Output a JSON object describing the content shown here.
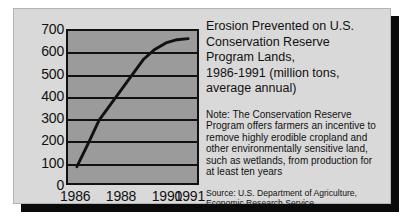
{
  "panel": {
    "background_color": "#d9d9d9",
    "shadow_color": "#0a0a0a"
  },
  "title_text": "Erosion Prevented on U.S.\nConservation Reserve\nProgram Lands,\n1986-1991 (million tons,\naverage annual)",
  "note_text": "Note: The Conservation Reserve\nProgram offers farmers an incentive to\nremove highly erodible cropland and\nother environmentally sensitive land,\nsuch as wetlands, from production for\nat least ten years",
  "source_text": "Source: U.S. Department of Agriculture,\nEconomic Research Service",
  "chart_data": {
    "type": "line",
    "title": "Erosion Prevented on U.S. Conservation Reserve Program Lands, 1986-1991 (million tons, average annual)",
    "xlabel": "",
    "ylabel": "",
    "xlim": [
      1985.6,
      1991.4
    ],
    "ylim": [
      0,
      700
    ],
    "grid": true,
    "legend": "none",
    "plot_background_color": "#9b9b9b",
    "line_color": "#111111",
    "x_tick_labels": [
      "1986",
      "1988",
      "1990",
      "1991"
    ],
    "x_tick_values": [
      1986,
      1988,
      1990,
      1991
    ],
    "y_tick_labels": [
      "0",
      "100",
      "200",
      "300",
      "400",
      "500",
      "600",
      "700"
    ],
    "y_tick_values": [
      0,
      100,
      200,
      300,
      400,
      500,
      600,
      700
    ],
    "x": [
      1986,
      1986.5,
      1987,
      1987.5,
      1988,
      1988.5,
      1989,
      1989.5,
      1990,
      1990.5,
      1991
    ],
    "values": [
      75,
      180,
      290,
      360,
      430,
      500,
      570,
      615,
      645,
      660,
      665
    ],
    "series": [
      {
        "name": "Erosion prevented (million tons, average annual)",
        "values": [
          75,
          180,
          290,
          360,
          430,
          500,
          570,
          615,
          645,
          660,
          665
        ]
      }
    ]
  }
}
